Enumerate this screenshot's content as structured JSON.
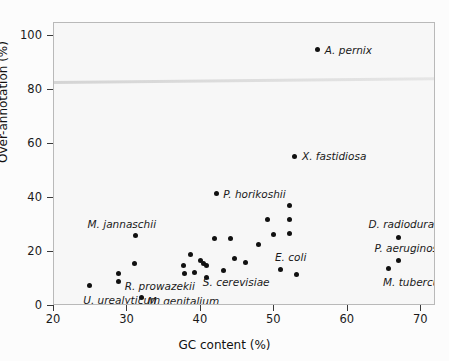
{
  "chart_data": {
    "type": "scatter",
    "title": "",
    "xlabel": "GC content (%)",
    "ylabel": "Over-annotation (%)",
    "xlim": [
      20,
      72
    ],
    "ylim": [
      0,
      105
    ],
    "xticks": [
      20,
      30,
      40,
      50,
      60,
      70
    ],
    "yticks": [
      0,
      20,
      40,
      60,
      80,
      100
    ],
    "grid": false,
    "legend": "none",
    "points": [
      {
        "x": 24.8,
        "y": 7.5,
        "label": "U. urealyticum",
        "label_dx": -6,
        "label_dy": 14,
        "label_anchor": "start"
      },
      {
        "x": 28.8,
        "y": 12.0,
        "label": "",
        "label_dx": 0,
        "label_dy": 0,
        "label_anchor": "start"
      },
      {
        "x": 28.8,
        "y": 9.0,
        "label": "R. prowazekii",
        "label_dx": 6,
        "label_dy": 4,
        "label_anchor": "start"
      },
      {
        "x": 31.0,
        "y": 15.6,
        "label": "",
        "label_dx": 0,
        "label_dy": 0,
        "label_anchor": "start"
      },
      {
        "x": 31.1,
        "y": 26.0,
        "label": "M. jannaschii",
        "label_dx": -48,
        "label_dy": -12,
        "label_anchor": "start"
      },
      {
        "x": 31.9,
        "y": 3.2,
        "label": "M. genitalium",
        "label_dx": 6,
        "label_dy": 4,
        "label_anchor": "start"
      },
      {
        "x": 37.6,
        "y": 15.0,
        "label": "",
        "label_dx": 0,
        "label_dy": 0,
        "label_anchor": "start"
      },
      {
        "x": 37.7,
        "y": 12.2,
        "label": "",
        "label_dx": 0,
        "label_dy": 0,
        "label_anchor": "start"
      },
      {
        "x": 38.6,
        "y": 19.2,
        "label": "",
        "label_dx": 0,
        "label_dy": 0,
        "label_anchor": "start"
      },
      {
        "x": 39.1,
        "y": 12.6,
        "label": "",
        "label_dx": 0,
        "label_dy": 0,
        "label_anchor": "start"
      },
      {
        "x": 39.9,
        "y": 16.8,
        "label": "",
        "label_dx": 0,
        "label_dy": 0,
        "label_anchor": "start"
      },
      {
        "x": 40.4,
        "y": 15.6,
        "label": "",
        "label_dx": 0,
        "label_dy": 0,
        "label_anchor": "start"
      },
      {
        "x": 40.8,
        "y": 15.0,
        "label": "S. cerevisiae",
        "label_dx": -4,
        "label_dy": 16,
        "label_anchor": "start"
      },
      {
        "x": 40.7,
        "y": 10.4,
        "label": "",
        "label_dx": 0,
        "label_dy": 0,
        "label_anchor": "start"
      },
      {
        "x": 41.8,
        "y": 25.0,
        "label": "",
        "label_dx": 0,
        "label_dy": 0,
        "label_anchor": "start"
      },
      {
        "x": 42.1,
        "y": 41.6,
        "label": "P. horikoshii",
        "label_dx": 7,
        "label_dy": 0,
        "label_anchor": "start"
      },
      {
        "x": 43.1,
        "y": 13.2,
        "label": "",
        "label_dx": 0,
        "label_dy": 0,
        "label_anchor": "start"
      },
      {
        "x": 44.0,
        "y": 25.0,
        "label": "",
        "label_dx": 0,
        "label_dy": 0,
        "label_anchor": "start"
      },
      {
        "x": 44.6,
        "y": 17.5,
        "label": "",
        "label_dx": 0,
        "label_dy": 0,
        "label_anchor": "start"
      },
      {
        "x": 46.0,
        "y": 16.2,
        "label": "",
        "label_dx": 0,
        "label_dy": 0,
        "label_anchor": "start"
      },
      {
        "x": 47.9,
        "y": 23.0,
        "label": "",
        "label_dx": 0,
        "label_dy": 0,
        "label_anchor": "start"
      },
      {
        "x": 49.1,
        "y": 32.0,
        "label": "",
        "label_dx": 0,
        "label_dy": 0,
        "label_anchor": "start"
      },
      {
        "x": 49.9,
        "y": 26.4,
        "label": "",
        "label_dx": 0,
        "label_dy": 0,
        "label_anchor": "start"
      },
      {
        "x": 50.9,
        "y": 13.4,
        "label": "E. coli",
        "label_dx": -6,
        "label_dy": -13,
        "label_anchor": "start"
      },
      {
        "x": 52.1,
        "y": 37.2,
        "label": "",
        "label_dx": 0,
        "label_dy": 0,
        "label_anchor": "start"
      },
      {
        "x": 52.1,
        "y": 32.0,
        "label": "",
        "label_dx": 0,
        "label_dy": 0,
        "label_anchor": "start"
      },
      {
        "x": 52.1,
        "y": 27.0,
        "label": "",
        "label_dx": 0,
        "label_dy": 0,
        "label_anchor": "start"
      },
      {
        "x": 53.0,
        "y": 11.6,
        "label": "",
        "label_dx": 0,
        "label_dy": 0,
        "label_anchor": "start"
      },
      {
        "x": 52.8,
        "y": 55.5,
        "label": "X. fastidiosa",
        "label_dx": 7,
        "label_dy": 0,
        "label_anchor": "start"
      },
      {
        "x": 55.9,
        "y": 95.0,
        "label": "A. pernix",
        "label_dx": 7,
        "label_dy": 0,
        "label_anchor": "start"
      },
      {
        "x": 65.6,
        "y": 14.0,
        "label": "M. tuberculosis",
        "label_dx": -6,
        "label_dy": 14,
        "label_anchor": "start"
      },
      {
        "x": 66.9,
        "y": 16.8,
        "label": "P. aeruginosa",
        "label_dx": -24,
        "label_dy": -13,
        "label_anchor": "start"
      },
      {
        "x": 66.9,
        "y": 25.6,
        "label": "D. radiodurans",
        "label_dx": -30,
        "label_dy": -13,
        "label_anchor": "start"
      }
    ]
  },
  "axes": {
    "x_title": "GC content (%)",
    "y_title": "Over-annotation (%)",
    "x_tick_labels": [
      "20",
      "30",
      "40",
      "50",
      "60",
      "70"
    ],
    "y_tick_labels": [
      "0",
      "20",
      "40",
      "60",
      "80",
      "100"
    ]
  },
  "style": {
    "point_color": "#111111",
    "frame_color": "#b9b9b9",
    "plot_background": "#f7f7f7",
    "text_color": "#1a1a1a"
  }
}
